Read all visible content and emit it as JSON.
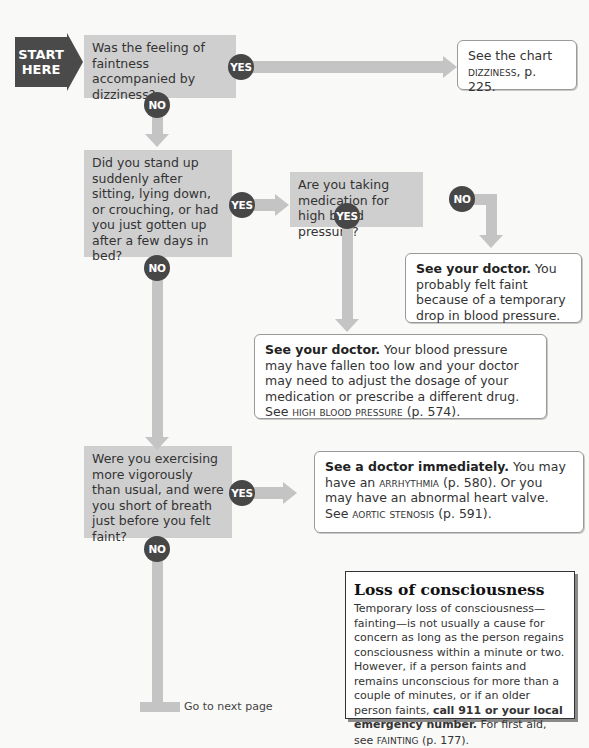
{
  "start": {
    "line1": "START",
    "line2": "HERE"
  },
  "labels": {
    "yes": "YES",
    "no": "NO"
  },
  "questions": [
    {
      "id": "q1",
      "text": "Was the feeling of faintness accompanied by dizziness?"
    },
    {
      "id": "q2",
      "text": "Did you stand up suddenly after sitting, lying down, or crouching, or had you just gotten up after a few days in bed?"
    },
    {
      "id": "q3",
      "text": "Are you taking medication for high blood pressure?"
    },
    {
      "id": "q4",
      "text": "Were you exercising more vigorously than usual, and were you short of breath just before you felt faint?"
    }
  ],
  "answers": {
    "a1": {
      "pre": "See the chart",
      "ref": "dizziness",
      "post": ", p. 225."
    },
    "a2": {
      "bold": "See your doctor.",
      "text": " You probably felt faint because of a temporary drop in blood pressure."
    },
    "a3": {
      "bold": "See your doctor.",
      "text": " Your blood pressure may have fallen too low and your doctor may need to adjust the dosage of your medication or prescribe a different drug. See ",
      "ref": "high blood pressure",
      "post": " (p. 574)."
    },
    "a4": {
      "bold": "See a doctor immediately.",
      "text1": " You may have an ",
      "ref1": "arrhythmia",
      "text2": " (p. 580). Or you may have an abnormal heart valve. See ",
      "ref2": "aortic stenosis",
      "post": " (p. 591)."
    }
  },
  "info_box": {
    "title": "Loss of consciousness",
    "body": "Temporary loss of consciousness—fainting—is not usually a cause for concern as long as the person regains consciousness within a minute or two. However, if a person faints and remains unconscious for more than a couple of minutes, or if an older person faints, ",
    "bold": "call 911 or your local emergency number.",
    "tail": " For first aid, see ",
    "ref": "fainting",
    "post": " (p. 177)."
  },
  "footer": {
    "next": "Go to next page"
  },
  "colors": {
    "question_bg": "#cfcfcf",
    "badge": "#474747",
    "connector": "#c4c4c4",
    "start": "#4a4a4a"
  }
}
